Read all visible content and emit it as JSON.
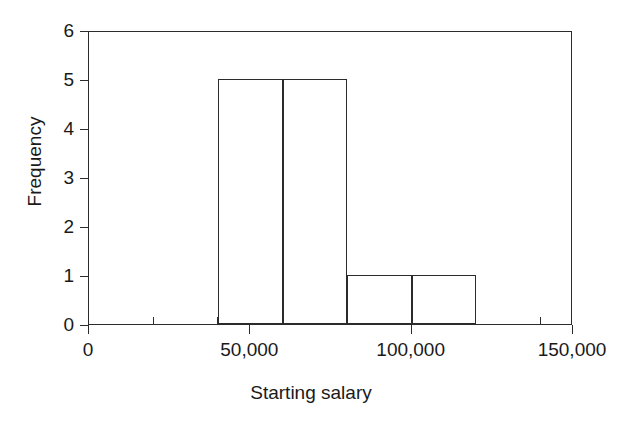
{
  "chart_data": {
    "type": "bar",
    "title": "",
    "subtitle": "",
    "xlabel": "Starting salary",
    "ylabel": "Frequency",
    "xlim": [
      0,
      150000
    ],
    "ylim": [
      0,
      6
    ],
    "grid": false,
    "legend": null,
    "bin_width": 20000,
    "bin_edges": [
      40000,
      60000,
      80000,
      100000,
      120000
    ],
    "categories": [
      "40,000-60,000",
      "60,000-80,000",
      "80,000-100,000",
      "100,000-120,000"
    ],
    "values": [
      5,
      5,
      1,
      1
    ],
    "bars": [
      {
        "label": "40,000-60,000",
        "x0": 40000,
        "x1": 60000,
        "frequency": 5
      },
      {
        "label": "60,000-80,000",
        "x0": 60000,
        "x1": 80000,
        "frequency": 5
      },
      {
        "label": "80,000-100,000",
        "x0": 80000,
        "x1": 100000,
        "frequency": 1
      },
      {
        "label": "100,000-120,000",
        "x0": 100000,
        "x1": 120000,
        "frequency": 1
      }
    ],
    "x_ticks": [
      {
        "value": 0,
        "label": "0",
        "type": "major"
      },
      {
        "value": 20000,
        "label": "",
        "type": "minor"
      },
      {
        "value": 40000,
        "label": "",
        "type": "minor"
      },
      {
        "value": 50000,
        "label": "50,000",
        "type": "major"
      },
      {
        "value": 60000,
        "label": "",
        "type": "minor"
      },
      {
        "value": 80000,
        "label": "",
        "type": "minor"
      },
      {
        "value": 100000,
        "label": "100,000",
        "type": "major"
      },
      {
        "value": 120000,
        "label": "",
        "type": "minor"
      },
      {
        "value": 140000,
        "label": "",
        "type": "minor"
      },
      {
        "value": 150000,
        "label": "150,000",
        "type": "major"
      }
    ],
    "y_ticks": [
      {
        "value": 0,
        "label": "0"
      },
      {
        "value": 1,
        "label": "1"
      },
      {
        "value": 2,
        "label": "2"
      },
      {
        "value": 3,
        "label": "3"
      },
      {
        "value": 4,
        "label": "4"
      },
      {
        "value": 5,
        "label": "5"
      },
      {
        "value": 6,
        "label": "6"
      }
    ],
    "colors": {
      "axis": "#2b2b2b",
      "bar_outline": "#2b2b2b",
      "bar_fill": "transparent",
      "background": "#ffffff",
      "text": "#1a1a1a"
    }
  }
}
